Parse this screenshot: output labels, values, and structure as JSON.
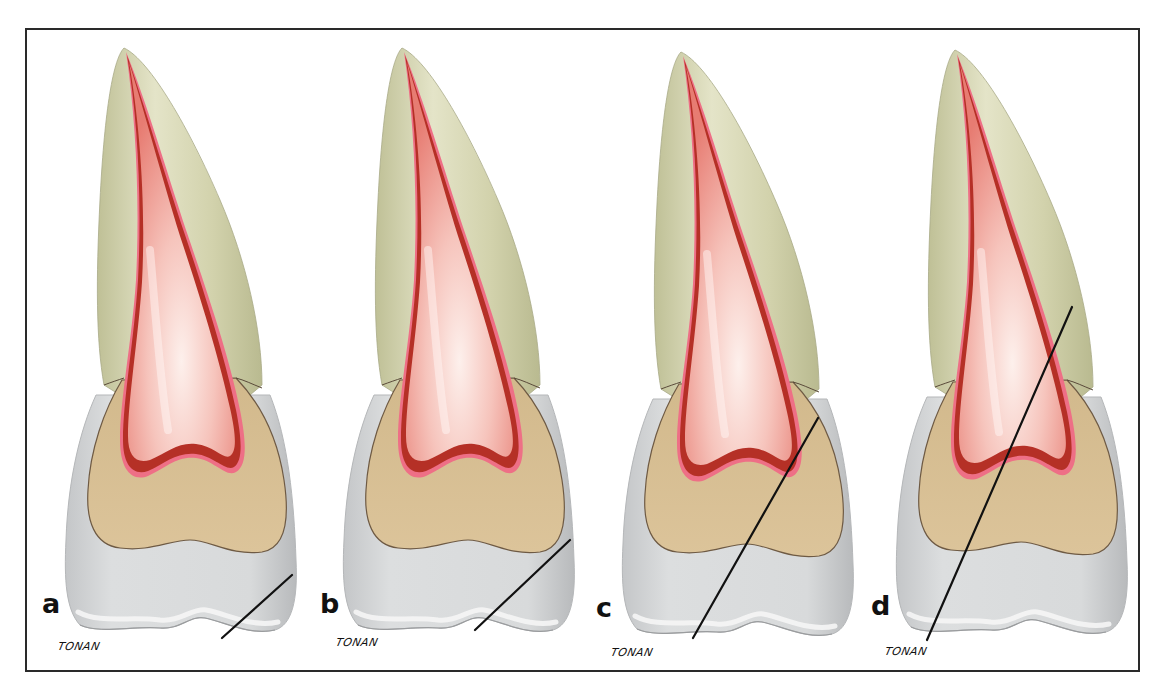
{
  "figure": {
    "panels": [
      {
        "label": "a",
        "signature": "TONAN",
        "offset_x": 0,
        "cut_line": {
          "x1": 292,
          "y1": 575,
          "x2": 222,
          "y2": 638
        }
      },
      {
        "label": "b",
        "signature": "TONAN",
        "offset_x": 278,
        "cut_line": {
          "x1": 570,
          "y1": 540,
          "x2": 475,
          "y2": 630
        }
      },
      {
        "label": "c",
        "signature": "TONAN",
        "offset_x": 557,
        "cut_line": {
          "x1": 818,
          "y1": 418,
          "x2": 693,
          "y2": 638
        }
      },
      {
        "label": "d",
        "signature": "TONAN",
        "offset_x": 831,
        "cut_line": {
          "x1": 1072,
          "y1": 307,
          "x2": 927,
          "y2": 640
        }
      }
    ],
    "colors": {
      "frame": "#2a2a2a",
      "enamel": "#d6d8d8",
      "enamel_edge": "#eeeeee",
      "dentin_root": "#cfcfa8",
      "dentin_crown": "#d8bf94",
      "pulp": "#f0a8a0",
      "pulp_highlight": "#fbe4e0",
      "pulp_wall": "#b8302a",
      "pulp_rim": "#ee6f86",
      "cut_line": "#111111"
    }
  }
}
